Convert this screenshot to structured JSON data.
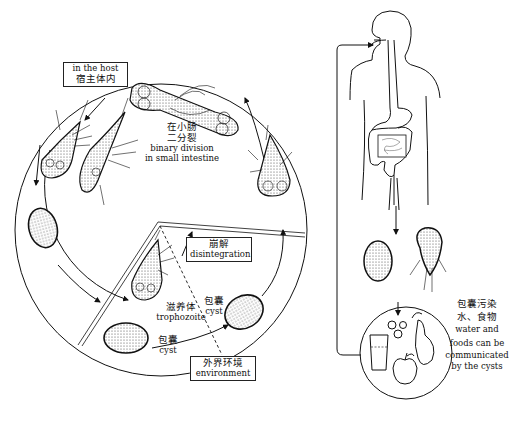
{
  "diagram": {
    "labels": {
      "in_host_en": "in the host",
      "in_host_cn": "宿主体内",
      "binary_cn_1": "在小肠",
      "binary_cn_2": "二分裂",
      "binary_en_1": "binary division",
      "binary_en_2": "in small intestine",
      "disintegration_cn": "崩解",
      "disintegration_en": "disintegration",
      "trophozoite_cn": "滋养体",
      "trophozoite_en": "trophozoite",
      "cyst_cn_upper": "包囊",
      "cyst_en_upper": "cyst",
      "cyst_cn_lower": "包囊",
      "cyst_en_lower": "cyst",
      "environment_cn": "外界环境",
      "environment_en": "environment",
      "contamination_cn_1": "包囊污染",
      "contamination_cn_2": "水、食物",
      "contamination_en_1": "water and",
      "contamination_en_2": "foods can be",
      "contamination_en_3": "communicated",
      "contamination_en_4": "by the cysts"
    },
    "stages": [
      "trophozoite (attached)",
      "binary division",
      "trophozoite (free)",
      "cyst (in host)",
      "cyst (excreted)",
      "cyst (environment)",
      "trophozoite disintegration"
    ],
    "icons": [
      "human-body-digestive-tract",
      "cyst-cell",
      "trophozoite-cell",
      "water-glass",
      "pear",
      "apple",
      "grapes"
    ],
    "colors": {
      "line": "#111111",
      "background": "#ffffff",
      "stipple": "#555555"
    }
  }
}
